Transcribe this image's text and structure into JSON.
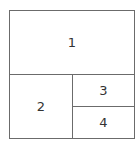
{
  "diagram": {
    "type": "panel-layout",
    "panels": [
      {
        "id": "1",
        "label": "1"
      },
      {
        "id": "2",
        "label": "2"
      },
      {
        "id": "3",
        "label": "3"
      },
      {
        "id": "4",
        "label": "4"
      }
    ],
    "colors": {
      "line": "#6b6b6b",
      "text": "#333333",
      "background": "#ffffff"
    }
  }
}
